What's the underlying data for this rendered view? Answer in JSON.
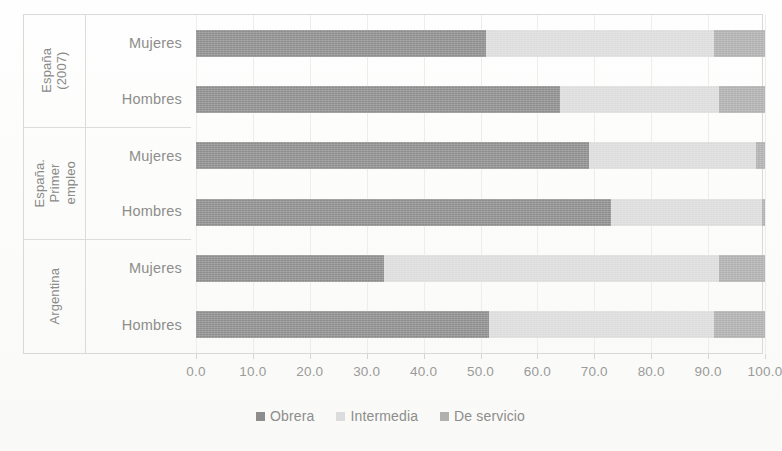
{
  "chart_data": {
    "type": "bar",
    "orientation": "horizontal",
    "stacked": true,
    "stack_mode": "percent",
    "title": "",
    "xlabel": "",
    "ylabel": "",
    "xlim": [
      0,
      100
    ],
    "xticks": [
      "0.0",
      "10.0",
      "20.0",
      "30.0",
      "40.0",
      "50.0",
      "60.0",
      "70.0",
      "80.0",
      "90.0",
      "100.0"
    ],
    "xtick_values": [
      0,
      10,
      20,
      30,
      40,
      50,
      60,
      70,
      80,
      90,
      100
    ],
    "grid": true,
    "legend_position": "bottom",
    "legend": [
      "Obrera",
      "Intermedia",
      "De servicio"
    ],
    "series": [
      {
        "name": "Obrera",
        "color": "#8d8d8d",
        "values": [
          51.0,
          64.0,
          69.0,
          73.0,
          33.0,
          51.5
        ]
      },
      {
        "name": "Intermedia",
        "color": "#dcdcdc",
        "values": [
          40.0,
          28.0,
          29.5,
          26.5,
          59.0,
          39.5
        ]
      },
      {
        "name": "De servicio",
        "color": "#b0b0b0",
        "values": [
          9.0,
          8.0,
          1.5,
          0.5,
          8.0,
          9.0
        ]
      }
    ],
    "groups": [
      {
        "label": "España\n(2007)",
        "categories": [
          "Mujeres",
          "Hombres"
        ]
      },
      {
        "label": "España.\nPrimer\nempleo",
        "categories": [
          "Mujeres",
          "Hombres"
        ]
      },
      {
        "label": "Argentina",
        "categories": [
          "Mujeres",
          "Hombres"
        ]
      }
    ],
    "categories": [
      "España (2007) — Mujeres",
      "España (2007) — Hombres",
      "España. Primer empleo — Mujeres",
      "España. Primer empleo — Hombres",
      "Argentina — Mujeres",
      "Argentina — Hombres"
    ]
  },
  "groups": [
    {
      "name": "España\n(2007)",
      "rows": [
        "Mujeres",
        "Hombres"
      ]
    },
    {
      "name": "España.\nPrimer\nempleo",
      "rows": [
        "Mujeres",
        "Hombres"
      ]
    },
    {
      "name": "Argentina",
      "rows": [
        "Mujeres",
        "Hombres"
      ]
    }
  ],
  "axis": {
    "ticks": [
      "0.0",
      "10.0",
      "20.0",
      "30.0",
      "40.0",
      "50.0",
      "60.0",
      "70.0",
      "80.0",
      "90.0",
      "100.0"
    ]
  },
  "legend": {
    "items": [
      {
        "label": "Obrera",
        "color": "#8d8d8d",
        "key": "obrera"
      },
      {
        "label": "Intermedia",
        "color": "#dcdcdc",
        "key": "intermedia"
      },
      {
        "label": "De servicio",
        "color": "#b0b0b0",
        "key": "servicio"
      }
    ]
  }
}
